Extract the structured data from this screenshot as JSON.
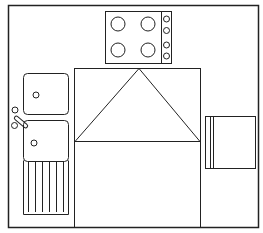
{
  "diagram": {
    "type": "kitchen-floor-plan",
    "colors": {
      "line": "#222222",
      "background": "#ffffff"
    },
    "elements": [
      {
        "id": "room-outline",
        "label": ""
      },
      {
        "id": "hob",
        "label": "",
        "burners": 4,
        "knobs": 4
      },
      {
        "id": "double-sink",
        "label": "",
        "bowls": 2,
        "drainer_grooves": 6
      },
      {
        "id": "tap",
        "label": ""
      },
      {
        "id": "refrigerator",
        "label": ""
      },
      {
        "id": "work-triangle",
        "label": ""
      },
      {
        "id": "central-area",
        "label": ""
      }
    ]
  }
}
